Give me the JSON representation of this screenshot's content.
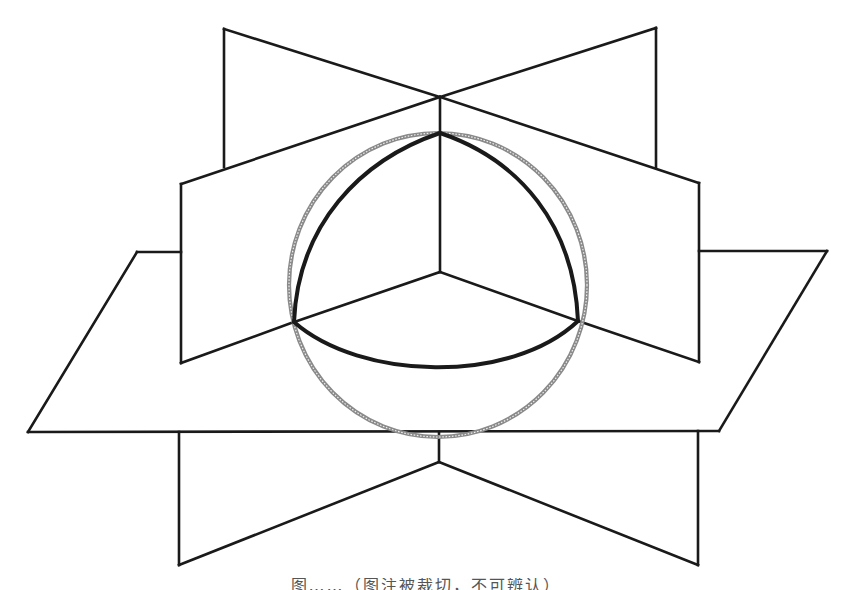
{
  "figure": {
    "stroke_color": "#1a1a1a",
    "sphere_color": "#7a7a7a",
    "background": "#ffffff",
    "elements": {
      "vertical_plane_left": "Vertical plane running back-left to front-right",
      "vertical_plane_right": "Vertical plane running back-right to front-left",
      "horizontal_plane": "Horizontal plane (parallelogram)",
      "sphere_outline": "Sphere outline (gray dotted circle)",
      "spherical_triangle": "Spherical triangle bounded by three great-circle arcs (bold)"
    }
  },
  "caption": {
    "text": "图……（图注被裁切，不可辨认）"
  }
}
